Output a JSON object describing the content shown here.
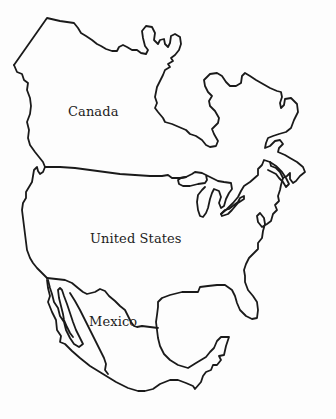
{
  "map": {
    "title": "North America",
    "background_color": "#ffffff",
    "outline_color": "#1a1a1a",
    "labels": {
      "canada": "Canada",
      "united_states": "United States",
      "mexico": "Mexico"
    }
  }
}
